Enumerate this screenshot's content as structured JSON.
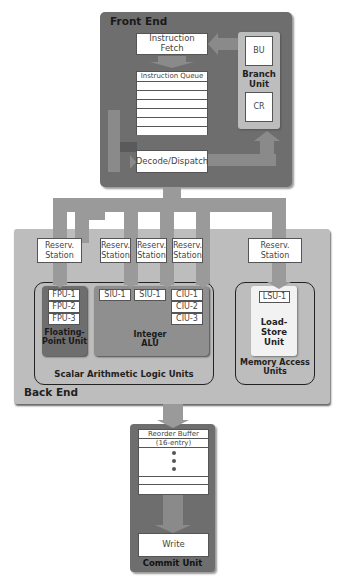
{
  "front_end": {
    "title": "Front End",
    "instruction_fetch": "Instruction Fetch",
    "instruction_queue": "Instruction Queue",
    "decode_dispatch": "Decode/Dispatch",
    "branch_unit": {
      "bu": "BU",
      "cr": "CR",
      "label_line1": "Branch",
      "label_line2": "Unit"
    }
  },
  "back_end": {
    "title": "Back End",
    "reservation_stations": [
      {
        "line1": "Reserv.",
        "line2": "Station"
      },
      {
        "line1": "Reserv.",
        "line2": "Station"
      },
      {
        "line1": "Reserv.",
        "line2": "Station"
      },
      {
        "line1": "Reserv.",
        "line2": "Station"
      },
      {
        "line1": "Reserv.",
        "line2": "Station"
      }
    ],
    "fpu": {
      "units": [
        "FPU-1",
        "FPU-2",
        "FPU-3"
      ],
      "label_line1": "Floating-",
      "label_line2": "Point Unit"
    },
    "integer_alu": {
      "siu": [
        "SIU-1",
        "SIU-1"
      ],
      "ciu": [
        "CIU-1",
        "CIU-2",
        "CIU-3"
      ],
      "label_line1": "Integer",
      "label_line2": "ALU"
    },
    "scalar_alu_label": "Scalar Arithmetic Logic Units",
    "lsu": {
      "unit": "LSU-1",
      "label_line1": "Load-",
      "label_line2": "Store",
      "label_line3": "Unit"
    },
    "memory_access_line1": "Memory Access",
    "memory_access_line2": "Units"
  },
  "commit_unit": {
    "title": "Commit Unit",
    "reorder_buffer_line1": "Reorder Buffer",
    "reorder_buffer_line2": "(16-entry)",
    "write": "Write"
  },
  "colors": {
    "front_end_bg": "#6e6e6e",
    "back_end_bg": "#bdbdbd",
    "arrow": "#9a9a9a",
    "fpu_bg": "#6e6e6e",
    "alu_bg": "#8f8f8f",
    "lsu_bg": "#f2f2f2"
  }
}
